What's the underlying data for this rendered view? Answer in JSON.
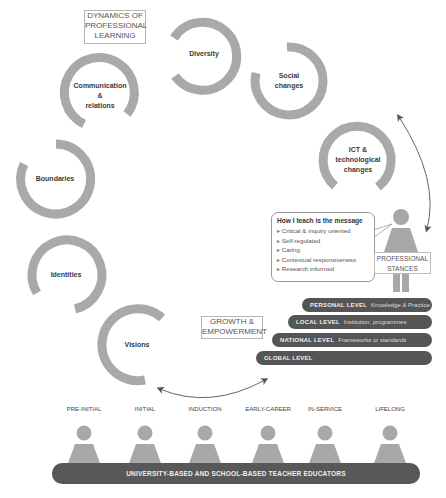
{
  "title_box": "DYNAMICS OF\nPROFESSIONAL\nLEARNING",
  "growth_box": "GROWTH &\nEMPOWERMENT",
  "rings": [
    {
      "label": "Diversity"
    },
    {
      "label": "Communication\n&\nrelations"
    },
    {
      "label": "Social\nchanges"
    },
    {
      "label": "ICT &\ntechnological\nchanges"
    },
    {
      "label": "Boundaries"
    },
    {
      "label": "Identities"
    },
    {
      "label": "Visions"
    }
  ],
  "bubble": {
    "title": "How I teach is the message",
    "items": [
      "Critical & inquiry oriented",
      "Self-regulated",
      "Caring",
      "Contextual responsiveness",
      "Research informed"
    ]
  },
  "stances_label": "PROFESSIONAL\nSTANCES",
  "levels": [
    {
      "name": "PERSONAL LEVEL",
      "desc": "Knowledge & Practice"
    },
    {
      "name": "LOCAL LEVEL",
      "desc": "Institution, programmes"
    },
    {
      "name": "NATIONAL LEVEL",
      "desc": "Frameworks or standards"
    },
    {
      "name": "GLOBAL LEVEL",
      "desc": ""
    }
  ],
  "stages": [
    "PRE-INITIAL",
    "INITIAL",
    "INDUCTION",
    "EARLY-CAREER",
    "IN-SERVICE",
    "LIFELONG"
  ],
  "educators_bar": "UNIVERSITY-BASED AND SCHOOL-BASED TEACHER EDUCATORS",
  "colors": {
    "ring": "#a9a9a9",
    "dark_bar": "#555555",
    "person": "#a8a8a8",
    "arrow": "#555555"
  }
}
